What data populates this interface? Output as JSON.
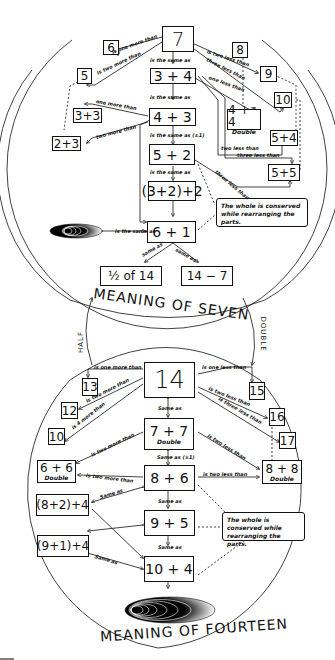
{
  "seven": {
    "title": "MEANING OF SEVEN",
    "center": "7",
    "n6": "6",
    "n5": "5",
    "n8": "8",
    "n9": "9",
    "n10": "10",
    "e34": "3 + 4",
    "e43": "4 + 3",
    "e52": "5 + 2",
    "e322": "(3+2)+2",
    "e61": "6 + 1",
    "e33": "3+3",
    "e23": "2+3",
    "e44": "4 + 4",
    "e44_sub": "Double",
    "e54": "5+4",
    "e55": "5+5",
    "half14": "½ of 14",
    "e147": "14 − 7",
    "note": "The whole is conserved while rearranging the parts.",
    "labels": {
      "one_more": "is one more than",
      "two_more": "is two more than",
      "two_less": "is two less than",
      "three_less": "three less than",
      "one_less": "one less than",
      "same1": "is the same as",
      "same2": "is the same as",
      "same3": "is the same as (±1)",
      "same4": "is the same as",
      "one_more_33": "one more than",
      "two_more_23": "two more than",
      "two_less_54": "two less than",
      "three_less_55a": "three less than",
      "three_less_55b": "three less than",
      "same_dots": "is the same as",
      "same_half": "same as",
      "same_147": "same as"
    }
  },
  "fourteen": {
    "title": "MEANING OF FOURTEEN",
    "center": "14",
    "n13": "13",
    "n12": "12",
    "n10": "10",
    "n15": "15",
    "n16": "16",
    "n17": "17",
    "e77": "7 + 7",
    "e77_sub": "Double",
    "e66": "6 + 6",
    "e66_sub": "Double",
    "e86": "8 + 6",
    "e88": "8 + 8",
    "e88_sub": "Double",
    "e824": "(8+2)+4",
    "e95": "9 + 5",
    "e914": "(9+1)+4",
    "e104": "10 + 4",
    "note": "The whole is conserved while rearranging the parts.",
    "labels": {
      "one_more": "is one more than",
      "two_more": "is two more than",
      "four_more": "is 4 more than",
      "one_less": "is one  less than",
      "two_less": "is two less than",
      "three_less": "is three less than",
      "same1": "Same as",
      "same2": "Same as (±1)",
      "same3": "Same as",
      "same4": "Same as",
      "two_more_66a": "is two more than",
      "two_more_66b": "is two more than",
      "two_less_77": "is two less than",
      "two_less_86": "is two less than",
      "same_824": "Same as",
      "same_914": "Same as"
    }
  },
  "connectors": {
    "half": "HALF",
    "double": "DOUBLE"
  }
}
